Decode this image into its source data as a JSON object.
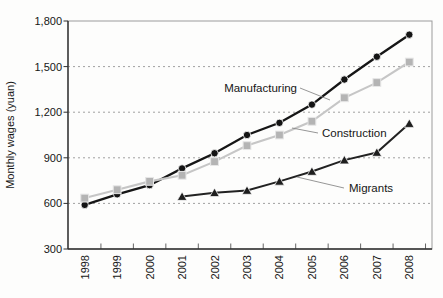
{
  "figure": {
    "background": "#fdfdfc",
    "axis_color": "#2e2e2e",
    "border_color": "#9b9b9b",
    "grid_color": "#a0a0a0",
    "callout_color": "#8a8a8a"
  },
  "chart_data": {
    "type": "line",
    "title": "",
    "xlabel": "",
    "ylabel": "Monthly wages (yuan)",
    "x_categories": [
      "1998",
      "1999",
      "2000",
      "2001",
      "2002",
      "2003",
      "2004",
      "2005",
      "2006",
      "2007",
      "2008"
    ],
    "ylim": [
      300,
      1800
    ],
    "yticks": [
      300,
      600,
      900,
      1200,
      1500,
      1800
    ],
    "ytick_labels": [
      "300",
      "600",
      "900",
      "1,200",
      "1,500",
      "1,800"
    ],
    "grid": "horizontal dashed",
    "legend": "inline annotations with leader lines",
    "series": [
      {
        "name": "Manufacturing",
        "marker": "circle",
        "line_color": "#161616",
        "marker_color": "#141414",
        "values": [
          590,
          660,
          720,
          830,
          930,
          1050,
          1130,
          1250,
          1415,
          1565,
          1710
        ]
      },
      {
        "name": "Construction",
        "marker": "square",
        "line_color": "#c6c6c6",
        "marker_color": "#b4b4b4",
        "values": [
          635,
          690,
          745,
          785,
          875,
          980,
          1050,
          1140,
          1295,
          1395,
          1530
        ]
      },
      {
        "name": "Migrants",
        "marker": "triangle",
        "line_color": "#222222",
        "marker_color": "#1e1e1e",
        "values": [
          null,
          null,
          null,
          645,
          670,
          685,
          745,
          810,
          885,
          935,
          1125
        ]
      }
    ],
    "annotations": [
      {
        "text": "Manufacturing",
        "series": "Manufacturing"
      },
      {
        "text": "Construction",
        "series": "Construction"
      },
      {
        "text": "Migrants",
        "series": "Migrants"
      }
    ]
  }
}
